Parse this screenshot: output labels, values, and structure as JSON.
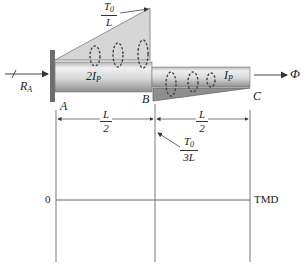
{
  "diagram": {
    "type": "torsion-shaft",
    "support": {
      "label": "R",
      "label_sub": "A"
    },
    "points": {
      "A": "A",
      "B": "B",
      "C": "C"
    },
    "segments": [
      {
        "name": "AB",
        "stiffness_coef": "2",
        "stiffness_sym": "I",
        "stiffness_sub": "P",
        "length_num": "L",
        "length_den": "2"
      },
      {
        "name": "BC",
        "stiffness_coef": "",
        "stiffness_sym": "I",
        "stiffness_sub": "P",
        "length_num": "L",
        "length_den": "2"
      }
    ],
    "loads": {
      "upper_peak": {
        "num": "T",
        "num_sub": "0",
        "den": "L"
      },
      "lower_peak": {
        "num": "T",
        "num_sub": "0",
        "den": "3L"
      }
    },
    "end_label": "Φ",
    "tmd": {
      "zero_label": "0",
      "axis_label": "TMD"
    },
    "colors": {
      "shaft_light": "#e6e6e6",
      "shaft_dark": "#9a9a9a",
      "load_fill": "#d4d4d4",
      "load_fill_dark": "#8f8f8f",
      "line": "#444444"
    }
  }
}
